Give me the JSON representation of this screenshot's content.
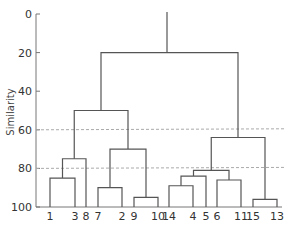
{
  "chart_data": {
    "type": "dendrogram",
    "title": "",
    "xlabel": "",
    "ylabel": "Similarity",
    "ylim": [
      0,
      100
    ],
    "y_inverted": true,
    "yticks": [
      "0",
      "20",
      "40",
      "60",
      "80",
      "100"
    ],
    "ytick_values": [
      0,
      20,
      40,
      60,
      80,
      100
    ],
    "grid": false,
    "reference_lines": [
      {
        "y": 60,
        "style": "dashed"
      },
      {
        "y": 80,
        "style": "dashed"
      }
    ],
    "leaf_order": [
      "1",
      "3",
      "8",
      "7",
      "2",
      "9",
      "10",
      "14",
      "4",
      "5",
      "6",
      "11",
      "15",
      "13"
    ],
    "leaf_x": [
      50,
      75,
      86,
      98,
      122,
      134,
      158,
      169,
      193,
      206,
      217,
      241,
      253,
      277
    ],
    "merges": [
      {
        "members": [
          "1",
          "3"
        ],
        "similarity": 85,
        "x1": 50,
        "x2": 75
      },
      {
        "members": [
          "1,3",
          "8"
        ],
        "similarity": 75,
        "x1": 62,
        "x2": 86
      },
      {
        "members": [
          "7",
          "2"
        ],
        "similarity": 90,
        "x1": 98,
        "x2": 122
      },
      {
        "members": [
          "9",
          "10"
        ],
        "similarity": 95,
        "x1": 134,
        "x2": 158
      },
      {
        "members": [
          "7,2",
          "9,10"
        ],
        "similarity": 70,
        "x1": 110,
        "x2": 146
      },
      {
        "members": [
          "1,3,8",
          "7,2,9,10"
        ],
        "similarity": 50,
        "x1": 74,
        "x2": 128
      },
      {
        "members": [
          "14",
          "4"
        ],
        "similarity": 89,
        "x1": 169,
        "x2": 193
      },
      {
        "members": [
          "14,4",
          "5"
        ],
        "similarity": 84,
        "x1": 181,
        "x2": 206
      },
      {
        "members": [
          "6",
          "11"
        ],
        "similarity": 86,
        "x1": 217,
        "x2": 241
      },
      {
        "members": [
          "14,4,5",
          "6,11"
        ],
        "similarity": 81,
        "x1": 193,
        "x2": 229
      },
      {
        "members": [
          "15",
          "13"
        ],
        "similarity": 96,
        "x1": 253,
        "x2": 277
      },
      {
        "members": [
          "14,4,5,6,11",
          "15,13"
        ],
        "similarity": 64,
        "x1": 211,
        "x2": 265
      },
      {
        "members": [
          "left",
          "right"
        ],
        "similarity": 20,
        "x1": 101,
        "x2": 238
      }
    ],
    "root_stem_x": 167
  },
  "colors": {
    "line": "#555555",
    "axis": "#777777",
    "dashed": "#aaaaaa",
    "text": "#333333"
  }
}
